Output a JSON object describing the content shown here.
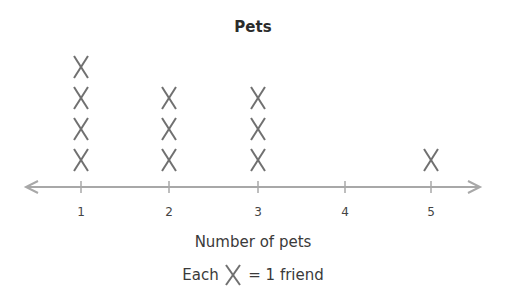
{
  "chart_data": {
    "type": "line_plot",
    "title": "Pets",
    "xlabel": "Number of pets",
    "ylabel": "",
    "categories": [
      1,
      2,
      3,
      4,
      5
    ],
    "values": [
      4,
      3,
      3,
      0,
      1
    ],
    "marker": "X",
    "legend": "Each X = 1 friend",
    "axis_range": [
      1,
      5
    ],
    "grid": false
  },
  "title": "Pets",
  "xlabel": "Number of pets",
  "legend": {
    "prefix": "Each",
    "suffix": "= 1 friend"
  },
  "ticks": [
    "1",
    "2",
    "3",
    "4",
    "5"
  ],
  "colors": {
    "mark": "#707070",
    "axis": "#a8a8a8",
    "text": "#3a3a3a"
  }
}
